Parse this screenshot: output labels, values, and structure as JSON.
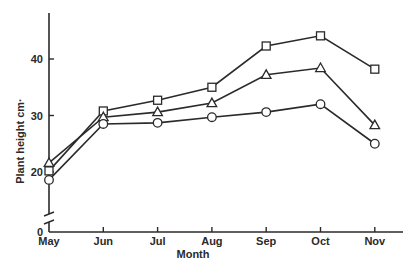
{
  "chart_data": {
    "type": "line",
    "title": "",
    "xlabel": "Month",
    "ylabel": "Plant height cm·",
    "categories": [
      "May",
      "Jun",
      "Jul",
      "Aug",
      "Sep",
      "Oct",
      "Nov"
    ],
    "y_ticks": [
      0,
      20,
      30,
      40
    ],
    "ylim": [
      0,
      48
    ],
    "axis_break": true,
    "grid": false,
    "legend": null,
    "series": [
      {
        "name": "square",
        "marker": "square",
        "values": [
          20.2,
          30.8,
          32.7,
          35.0,
          42.3,
          44.1,
          38.2
        ]
      },
      {
        "name": "triangle",
        "marker": "triangle",
        "values": [
          21.6,
          29.7,
          30.6,
          32.2,
          37.2,
          38.4,
          28.3
        ]
      },
      {
        "name": "circle",
        "marker": "circle",
        "values": [
          18.6,
          28.5,
          28.7,
          29.7,
          30.6,
          32.0,
          25.0
        ]
      }
    ]
  },
  "colors": {
    "ink": "#2a2a2a",
    "background": "#ffffff"
  }
}
